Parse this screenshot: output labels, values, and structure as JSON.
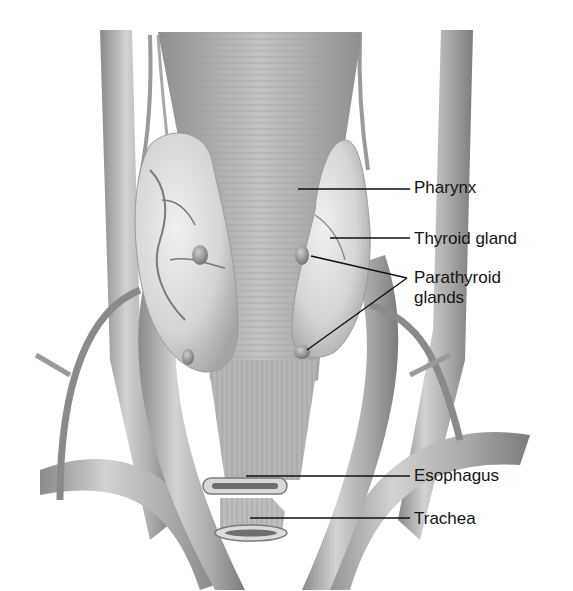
{
  "figure": {
    "colors": {
      "background": "#ffffff",
      "tissue_light": "#e4e4e4",
      "tissue_mid": "#b8b8b8",
      "tissue_dark": "#7a7a7a",
      "leader_line": "#111111",
      "label_text": "#141414"
    },
    "labels": [
      {
        "id": "pharynx",
        "text": "Pharynx",
        "x": 414,
        "y": 178,
        "line_from": [
          298,
          189
        ],
        "line_to": [
          410,
          189
        ]
      },
      {
        "id": "thyroid-gland",
        "text": "Thyroid gland",
        "x": 414,
        "y": 229,
        "line_from": [
          330,
          238
        ],
        "line_to": [
          410,
          238
        ]
      },
      {
        "id": "parathyroid-glands-1",
        "text": "Parathyroid",
        "x": 414,
        "y": 270,
        "line_from": [
          311,
          256
        ],
        "line_to": [
          407,
          278
        ]
      },
      {
        "id": "parathyroid-glands-2",
        "text": "glands",
        "x": 414,
        "y": 290,
        "line_from": [
          307,
          350
        ],
        "line_to": [
          407,
          278
        ]
      },
      {
        "id": "esophagus",
        "text": "Esophagus",
        "x": 414,
        "y": 466,
        "line_from": [
          246,
          476
        ],
        "line_to": [
          410,
          476
        ]
      },
      {
        "id": "trachea",
        "text": "Trachea",
        "x": 414,
        "y": 509,
        "line_from": [
          250,
          518
        ],
        "line_to": [
          410,
          518
        ]
      }
    ]
  }
}
